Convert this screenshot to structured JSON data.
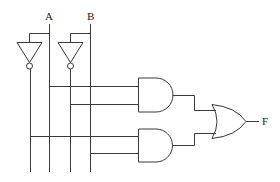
{
  "diagram": {
    "type": "logic-circuit",
    "inputs": [
      {
        "id": "A",
        "label": "A"
      },
      {
        "id": "B",
        "label": "B"
      }
    ],
    "output": {
      "id": "F",
      "label": "F"
    },
    "gates": [
      {
        "id": "not-a",
        "type": "NOT",
        "input": "A"
      },
      {
        "id": "not-b",
        "type": "NOT",
        "input": "B"
      },
      {
        "id": "and-1",
        "type": "AND",
        "inputs": [
          "A",
          "NOT B"
        ]
      },
      {
        "id": "and-2",
        "type": "AND",
        "inputs": [
          "NOT A",
          "B"
        ]
      },
      {
        "id": "or-1",
        "type": "OR",
        "inputs": [
          "and-1",
          "and-2"
        ],
        "output": "F"
      }
    ],
    "colors": {
      "wire": "#3a3a3a",
      "background": "#ffffff"
    }
  }
}
